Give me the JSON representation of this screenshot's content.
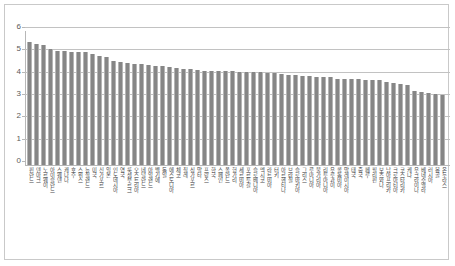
{
  "chart_data": {
    "type": "bar",
    "title": "",
    "xlabel": "",
    "ylabel": "",
    "ylim": [
      0,
      6
    ],
    "ytick_labels": [
      "0",
      "1",
      "2",
      "3",
      "4",
      "5",
      "6"
    ],
    "ytick_values": [
      0,
      1,
      2,
      3,
      4,
      5,
      6
    ],
    "grid": true,
    "legend": "none",
    "orientation": "vertical",
    "bar_color": "#868686",
    "categories": [
      "핀란드",
      "덴마크",
      "노르웨이",
      "아이슬란드",
      "스웨덴",
      "캐나다",
      "호주",
      "스위스",
      "뉴질랜드",
      "미국",
      "신가포르",
      "일본",
      "인도네시아",
      "영국",
      "룩셈부르크",
      "오스트리아",
      "네덜란드",
      "아일랜드",
      "벨기에",
      "독일",
      "에스토니아",
      "체코",
      "칠레",
      "싱가포르",
      "말타",
      "프랑스",
      "한국",
      "스페인",
      "폴란드",
      "헝가리",
      "세르비아",
      "포르투갈",
      "슬로베니아",
      "멕시코",
      "라트비아",
      "터키",
      "아르헨티나",
      "브라질",
      "슬로바키아",
      "그리스",
      "루마니아",
      "불가리아",
      "리투아니아",
      "우루과이",
      "콜롬비아",
      "말레이시아",
      "태국",
      "중국",
      "페루",
      "필리핀",
      "보츠와나",
      "남아프리카",
      "크로아티아",
      "코스타리카",
      "케냐",
      "우크라이나",
      "베네수엘라",
      "러시아",
      "몽골",
      "온두라스"
    ],
    "values": [
      5.5,
      5.43,
      5.36,
      5.18,
      5.12,
      5.11,
      5.08,
      5.06,
      5.05,
      4.95,
      4.88,
      4.83,
      4.64,
      4.6,
      4.56,
      4.54,
      4.53,
      4.47,
      4.43,
      4.42,
      4.41,
      4.35,
      4.32,
      4.3,
      4.25,
      4.22,
      4.21,
      4.2,
      4.2,
      4.19,
      4.18,
      4.17,
      4.16,
      4.15,
      4.14,
      4.12,
      4.06,
      4.04,
      4.03,
      3.99,
      3.97,
      3.96,
      3.96,
      3.94,
      3.86,
      3.86,
      3.86,
      3.85,
      3.82,
      3.8,
      3.79,
      3.72,
      3.66,
      3.61,
      3.57,
      3.3,
      3.25,
      3.22,
      3.18,
      3.12
    ]
  },
  "axis": {
    "y_min_label": "0",
    "y_max_label": "6"
  }
}
